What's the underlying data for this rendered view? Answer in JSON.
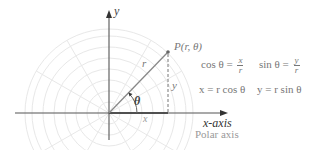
{
  "diagram": {
    "colors": {
      "grid": "#e6e6e6",
      "axis": "#555555",
      "arm": "#888888",
      "text": "#555555",
      "formula_text": "#777777",
      "polar_axis_text": "#999999"
    },
    "axes": {
      "y_label": "y",
      "x_label": "x-axis",
      "polar_axis_label": "Polar axis"
    },
    "point": {
      "label": "P(r, θ)"
    },
    "segment_labels": {
      "r": "r",
      "theta": "θ",
      "x": "x",
      "y": "y"
    },
    "formulas": {
      "cos": {
        "lhs": "cos θ =",
        "num": "x",
        "den": "r"
      },
      "sin": {
        "lhs": "sin θ =",
        "num": "y",
        "den": "r"
      },
      "x_eq": "x = r cos θ",
      "y_eq": "y = r sin θ"
    }
  }
}
